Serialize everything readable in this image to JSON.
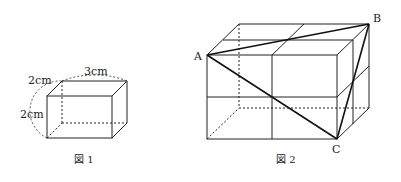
{
  "figure1": {
    "caption": "図 1",
    "labels": {
      "depth": "2cm",
      "height": "2cm",
      "width": "3cm"
    }
  },
  "figure2": {
    "caption": "図 2",
    "points": {
      "A": "A",
      "B": "B",
      "C": "C"
    }
  },
  "colors": {
    "line": "#222222",
    "background": "#ffffff"
  }
}
